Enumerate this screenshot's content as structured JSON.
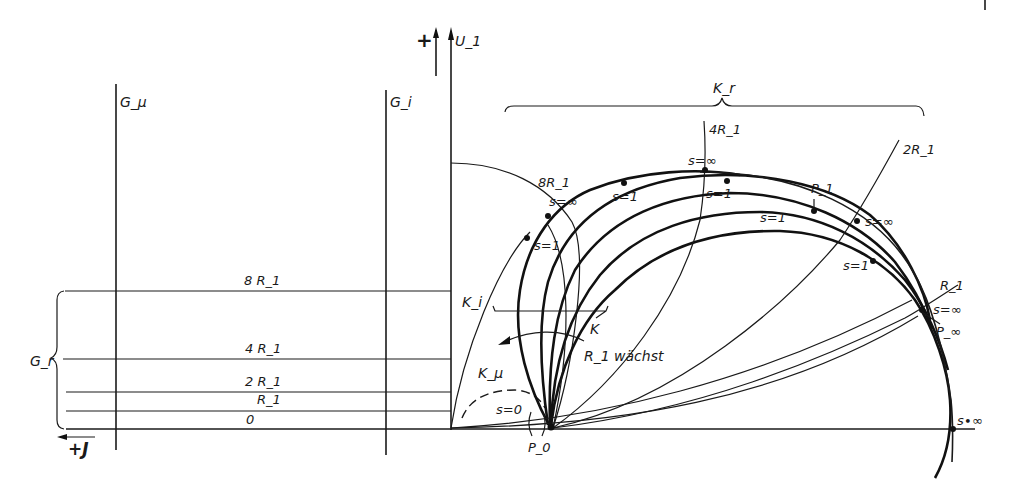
{
  "figure": {
    "type": "circle-diagram",
    "axes": {
      "vertical": {
        "label": "U_1",
        "sign_label": "+"
      },
      "horizontal": {
        "label": "+J",
        "direction": "left"
      }
    },
    "lines": {
      "g_mu": "G_μ",
      "g_i": "G_i",
      "g_r": "G_r"
    },
    "g_r_levels": [
      {
        "label": "8 R_1"
      },
      {
        "label": "4 R_1"
      },
      {
        "label": "2 R_1"
      },
      {
        "label": "R_1"
      },
      {
        "label": "0"
      }
    ],
    "curve_labels": {
      "k_r": "K_r",
      "k_i": "K_i",
      "k_mu": "K_μ",
      "k": "K",
      "r1_grows": "R_1 wächst"
    },
    "resistance_curves": {
      "r8": "8R_1",
      "r4": "4R_1",
      "r2": "2R_1",
      "r1": "R_1"
    },
    "slip_labels": {
      "s_inf_1": "s=∞",
      "s_inf_2": "s=∞",
      "s_inf_3": "s=∞",
      "s_inf_4": "s=∞",
      "s_inf_5": "s∙∞",
      "s1_a": "s=1",
      "s1_b": "s=1",
      "s1_c": "s=1",
      "s1_d": "s=1",
      "s1_e": "s=1",
      "s0": "s=0"
    },
    "points": {
      "p0": "P_0",
      "p1": "P_1",
      "p_inf": "P_∞"
    }
  }
}
